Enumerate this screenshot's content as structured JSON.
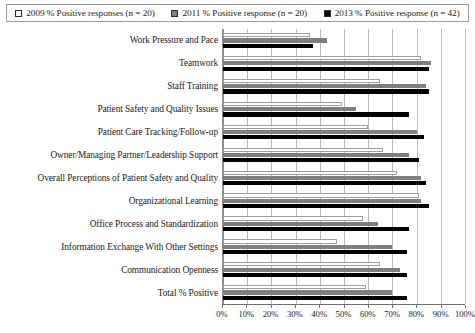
{
  "chart_data": {
    "type": "bar",
    "orientation": "horizontal",
    "title": "",
    "subtitle": "",
    "xlabel": "",
    "ylabel": "",
    "xlim": [
      0,
      100
    ],
    "xticks": [
      "0%",
      "10%",
      "20%",
      "30%",
      "40%",
      "50%",
      "60%",
      "70%",
      "80%",
      "90%",
      "100%"
    ],
    "xtick_values": [
      0,
      10,
      20,
      30,
      40,
      50,
      60,
      70,
      80,
      90,
      100
    ],
    "grid": true,
    "legend_position": "top",
    "legend": [
      {
        "label": "2009 % Positive responses (n = 20)",
        "swatch": "white",
        "color": "#ffffff"
      },
      {
        "label": "2011 % Positive response (n = 20)",
        "swatch": "gray",
        "color": "#7e7e7e"
      },
      {
        "label": "2013 % Positive response (n = 42)",
        "swatch": "black",
        "color": "#000000"
      }
    ],
    "categories": [
      "Work Pressure and Pace",
      "Teamwork",
      "Staff Training",
      "Patient Safety and Quality Issues",
      "Patient Care Tracking/Follow-up",
      "Owner/Managing Partner/Leadership Support",
      "Overall Perceptions of Patient Safety and Quality",
      "Organizational Learning",
      "Office Process and Standardization",
      "Information Exchange With Other Settings",
      "Communication Openness",
      "Total % Positive"
    ],
    "series": [
      {
        "name": "2009 % Positive responses (n = 20)",
        "color": "#ffffff",
        "values": [
          36,
          82,
          65,
          49,
          60,
          66,
          72,
          81,
          58,
          47,
          65,
          59
        ]
      },
      {
        "name": "2011 % Positive response (n = 20)",
        "color": "#7e7e7e",
        "values": [
          43,
          86,
          84,
          55,
          80,
          77,
          82,
          82,
          64,
          70,
          73,
          70
        ]
      },
      {
        "name": "2013 % Positive response (n = 42)",
        "color": "#000000",
        "values": [
          37,
          85,
          85,
          77,
          83,
          81,
          84,
          85,
          77,
          76,
          76,
          76
        ]
      }
    ]
  }
}
